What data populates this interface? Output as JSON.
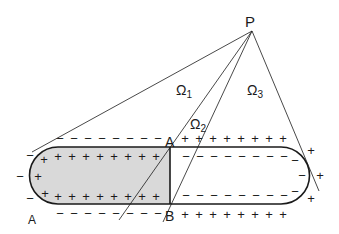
{
  "diagram": {
    "labels": {
      "point_P": "P",
      "omega1": "Ω",
      "omega1_sub": "1",
      "omega2": "Ω",
      "omega2_sub": "2",
      "omega3": "Ω",
      "omega3_sub": "3",
      "point_A_top": "A",
      "point_B_bottom": "B",
      "region_A": "A"
    },
    "signs": {
      "plus": "+",
      "minus": "−"
    },
    "colors": {
      "stroke": "#1a1a1a",
      "shaded_region": "#d9d9d9",
      "background": "#ffffff"
    }
  }
}
